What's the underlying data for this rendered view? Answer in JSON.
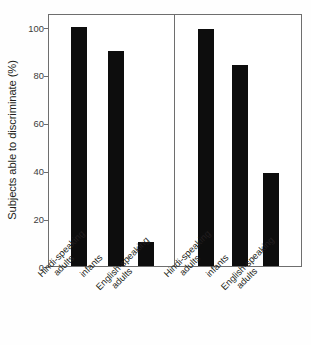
{
  "chart_data": {
    "type": "bar",
    "title": "",
    "subtitle": "",
    "xlabel": "",
    "ylabel": "Subjects able to discriminate (%)",
    "ylim": [
      0,
      105
    ],
    "yticks": [
      0,
      20,
      40,
      60,
      80,
      100
    ],
    "ytick_labels": [
      "0",
      "20",
      "40",
      "60",
      "80",
      "100"
    ],
    "grid": false,
    "legend": null,
    "legend_position": "none",
    "bar_color": "#0d0d0d",
    "panels": [
      {
        "name": "left-panel",
        "categories": [
          "Hindi-speaking adults",
          "infants",
          "English-speaking adults"
        ],
        "values": [
          100,
          90,
          10
        ]
      },
      {
        "name": "right-panel",
        "categories": [
          "Hindi-speaking adults",
          "infants",
          "English-speaking adults"
        ],
        "values": [
          99,
          84,
          39
        ]
      }
    ],
    "categories": [
      "Hindi-speaking adults",
      "infants",
      "English-speaking adults",
      "Hindi-speaking adults",
      "infants",
      "English-speaking adults"
    ],
    "values": [
      100,
      90,
      10,
      99,
      84,
      39
    ],
    "annotations": []
  },
  "axis": {
    "ylabel": "Subjects able to discriminate (%)",
    "ticks": [
      {
        "value": 100,
        "label": "100"
      },
      {
        "value": 80,
        "label": "80"
      },
      {
        "value": 60,
        "label": "60"
      },
      {
        "value": 40,
        "label": "40"
      },
      {
        "value": 20,
        "label": "20"
      },
      {
        "value": 0,
        "label": "0"
      }
    ]
  },
  "xcategories": [
    {
      "line1": "Hindi-speaking",
      "line2": "adults"
    },
    {
      "line1": "infants",
      "line2": ""
    },
    {
      "line1": "English-speaking",
      "line2": "adults"
    },
    {
      "line1": "Hindi-speaking",
      "line2": "adults"
    },
    {
      "line1": "infants",
      "line2": ""
    },
    {
      "line1": "English-speaking",
      "line2": "adults"
    }
  ]
}
